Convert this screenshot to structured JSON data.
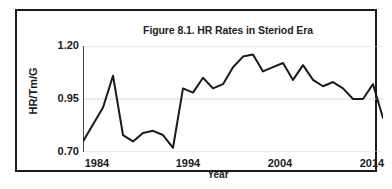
{
  "chart_data": {
    "type": "line",
    "title": "Figure 8.1. HR Rates in Steriod Era",
    "xlabel": "Year",
    "ylabel": "HR/Tm/G",
    "xlim": [
      1984,
      2014
    ],
    "ylim": [
      0.7,
      1.2
    ],
    "xticks": [
      "1984",
      "1994",
      "2004",
      "2014"
    ],
    "xtick_values": [
      1984,
      1994,
      2004,
      2014
    ],
    "yticks": [
      "1.20",
      "0.95",
      "0.70"
    ],
    "ytick_values": [
      1.2,
      0.95,
      0.7
    ],
    "grid": "horizontal",
    "legend": "none",
    "line_color": "#1a1a1a",
    "line_width": 2,
    "x": [
      1984,
      1985,
      1986,
      1987,
      1988,
      1989,
      1990,
      1991,
      1992,
      1993,
      1994,
      1995,
      1996,
      1997,
      1998,
      1999,
      2000,
      2001,
      2002,
      2003,
      2004,
      2005,
      2006,
      2007,
      2008,
      2009,
      2010,
      2011,
      2012,
      2013,
      2014
    ],
    "values": [
      0.75,
      0.83,
      0.91,
      1.06,
      0.78,
      0.75,
      0.79,
      0.8,
      0.78,
      0.72,
      1.0,
      0.98,
      1.05,
      1.0,
      1.02,
      1.1,
      1.15,
      1.16,
      1.08,
      1.1,
      1.12,
      1.04,
      1.11,
      1.04,
      1.01,
      1.03,
      1.0,
      0.95,
      0.95,
      1.02,
      0.86
    ],
    "series": [
      {
        "name": "HR/Tm/G",
        "values": [
          0.75,
          0.83,
          0.91,
          1.06,
          0.78,
          0.75,
          0.79,
          0.8,
          0.78,
          0.72,
          1.0,
          0.98,
          1.05,
          1.0,
          1.02,
          1.1,
          1.15,
          1.16,
          1.08,
          1.1,
          1.12,
          1.04,
          1.11,
          1.04,
          1.01,
          1.03,
          1.0,
          0.95,
          0.95,
          1.02,
          0.86
        ]
      }
    ]
  },
  "figure": {
    "title": "Figure 8.1. HR Rates in Steriod Era",
    "x_axis_label": "Year",
    "y_axis_label": "HR/Tm/G",
    "y_ticks": [
      "1.20",
      "0.95",
      "0.70"
    ],
    "x_ticks": [
      "1984",
      "1994",
      "2004",
      "2014"
    ]
  }
}
